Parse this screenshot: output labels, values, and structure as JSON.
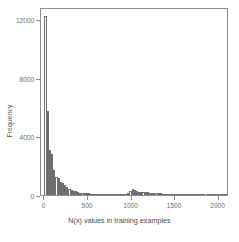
{
  "chart_data": {
    "type": "bar",
    "title": "",
    "subtitle": "",
    "xlabel": "N(x) values in training examples",
    "ylabel": "Frequency",
    "xlim": [
      -40,
      2120
    ],
    "ylim": [
      0,
      12800
    ],
    "grid": false,
    "legend": null,
    "bin_width": 25,
    "x_ticks": [
      0,
      500,
      1000,
      1500,
      2000
    ],
    "x_tick_labels": [
      "0",
      "500",
      "1000",
      "1500",
      "2000"
    ],
    "y_ticks": [
      0,
      4000,
      8000,
      12000
    ],
    "y_tick_labels": [
      "0",
      "4000",
      "8000",
      "12000"
    ],
    "bin_starts": [
      0,
      25,
      50,
      75,
      100,
      125,
      150,
      175,
      200,
      225,
      250,
      275,
      300,
      325,
      350,
      375,
      400,
      425,
      450,
      475,
      500,
      525,
      550,
      575,
      600,
      625,
      650,
      675,
      700,
      725,
      750,
      775,
      800,
      825,
      850,
      875,
      900,
      925,
      950,
      975,
      1000,
      1025,
      1050,
      1075,
      1100,
      1125,
      1150,
      1175,
      1200,
      1225,
      1250,
      1275,
      1300,
      1325,
      1350,
      1375,
      1400,
      1425,
      1450,
      1475,
      1500,
      1525,
      1550,
      1575,
      1600,
      1625,
      1650,
      1675,
      1700,
      1725,
      1750,
      1775,
      1800,
      1825,
      1850,
      1875,
      1900,
      1925,
      1950,
      1975,
      2000,
      2025,
      2050,
      2075
    ],
    "values": [
      12200,
      5750,
      3050,
      2800,
      1700,
      1250,
      1150,
      900,
      820,
      700,
      560,
      430,
      330,
      300,
      250,
      200,
      170,
      150,
      140,
      130,
      120,
      100,
      95,
      80,
      70,
      60,
      55,
      45,
      40,
      35,
      30,
      28,
      25,
      25,
      22,
      20,
      30,
      60,
      140,
      260,
      420,
      330,
      250,
      200,
      180,
      210,
      200,
      190,
      170,
      160,
      150,
      130,
      120,
      110,
      95,
      80,
      70,
      60,
      50,
      45,
      90,
      30,
      25,
      22,
      20,
      18,
      16,
      15,
      14,
      13,
      12,
      11,
      10,
      10,
      9,
      9,
      8,
      8,
      7,
      7,
      60,
      6,
      5,
      5
    ],
    "colors": {
      "bar_stroke": "#6e6e6e",
      "bar_fill": "transparent",
      "axis": "#8d8d8d",
      "text": "#5a5a5a"
    }
  }
}
